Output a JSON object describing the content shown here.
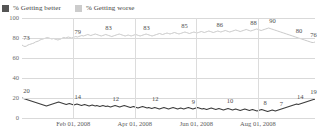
{
  "legend": {
    "position": "top-left",
    "items": [
      {
        "label": "% Getting better",
        "color": "#555555",
        "swatch_name": "legend-swatch-better"
      },
      {
        "label": "% Getting worse",
        "color": "#cccccc",
        "swatch_name": "legend-swatch-worse"
      }
    ]
  },
  "chart_data": {
    "type": "line",
    "title": "",
    "subtitle": "",
    "xlabel": "",
    "ylabel": "",
    "ylim": [
      0,
      100
    ],
    "yticks": [
      0,
      20,
      40,
      60,
      80,
      100
    ],
    "ytick_labels": [
      "0",
      "20",
      "40",
      "60",
      "80",
      "100"
    ],
    "grid": true,
    "xtick_labels": [
      "Feb 01, 2008",
      "Apr 01, 2008",
      "Jun 01, 2008",
      "Aug 01, 2008"
    ],
    "xtick_positions_pct": [
      17.5,
      38.5,
      59.5,
      80.5
    ],
    "legend_position": "top-left",
    "series": [
      {
        "name": "% Getting worse",
        "color": "#c9c9c9",
        "annotations": [
          {
            "value": 73,
            "label": "73",
            "x_pct": 1.5
          },
          {
            "value": 79,
            "label": "79",
            "x_pct": 19.0
          },
          {
            "value": 83,
            "label": "83",
            "x_pct": 29.5
          },
          {
            "value": 83,
            "label": "83",
            "x_pct": 42.5
          },
          {
            "value": 85,
            "label": "85",
            "x_pct": 55.5
          },
          {
            "value": 86,
            "label": "86",
            "x_pct": 67.5
          },
          {
            "value": 88,
            "label": "88",
            "x_pct": 79.0
          },
          {
            "value": 90,
            "label": "90",
            "x_pct": 85.5
          },
          {
            "value": 80,
            "label": "80",
            "x_pct": 94.5
          },
          {
            "value": 76,
            "label": "76",
            "x_pct": 99.5
          }
        ],
        "values": [
          73,
          72,
          71.5,
          72,
          73,
          73.5,
          74,
          74.5,
          75,
          76,
          76.5,
          77,
          78,
          78.5,
          79,
          79.5,
          80,
          80.5,
          80,
          79.5,
          79,
          79.5,
          79,
          78.5,
          78,
          78.5,
          79,
          80,
          80.5,
          80,
          80.5,
          81,
          80.5,
          80,
          80.5,
          81,
          81.5,
          81,
          81.5,
          82,
          82.5,
          82,
          82.5,
          83,
          83.5,
          83,
          82.5,
          83,
          83.5,
          84,
          83.5,
          83,
          82.5,
          82,
          82.5,
          83,
          83.5,
          83,
          82.5,
          82,
          81.5,
          82,
          82.5,
          83,
          83.5,
          84,
          83.5,
          83,
          82.5,
          82,
          82.5,
          83,
          82.5,
          82,
          82.5,
          83,
          83.5,
          83,
          82.5,
          82,
          82.5,
          83,
          83.5,
          84,
          83.5,
          83,
          82.5,
          82,
          82.5,
          83,
          83.5,
          84,
          84.5,
          84,
          83.5,
          84,
          84.5,
          85,
          84.5,
          84,
          84.5,
          85,
          85.5,
          85,
          84.5,
          84,
          84.5,
          85,
          85.5,
          86,
          85.5,
          85,
          84.5,
          85,
          85.5,
          86,
          85.5,
          85,
          85.5,
          86,
          86.5,
          86,
          85.5,
          86,
          86.5,
          87,
          86.5,
          86,
          85.5,
          86,
          86.5,
          87,
          86.5,
          86,
          86.5,
          87,
          87.5,
          87,
          86.5,
          86,
          86.5,
          87,
          87.5,
          88,
          87.5,
          87,
          86.5,
          87,
          87.5,
          88,
          88.5,
          88,
          87.5,
          87,
          87.5,
          88,
          88.5,
          89,
          88.5,
          88,
          87.5,
          88,
          88.5,
          89,
          89.5,
          90,
          89.5,
          89,
          88.5,
          88,
          87.5,
          87,
          86.5,
          86,
          85.5,
          85,
          84.5,
          84,
          83.5,
          83,
          82.5,
          82,
          81.5,
          81,
          80.5,
          80,
          79.5,
          79,
          78.5,
          78,
          77.5,
          77,
          76.5,
          76,
          75.5,
          75.5,
          76
        ]
      },
      {
        "name": "% Getting better",
        "color": "#3d3d3d",
        "annotations": [
          {
            "value": 20,
            "label": "20",
            "x_pct": 1.5
          },
          {
            "value": 14,
            "label": "14",
            "x_pct": 19.0
          },
          {
            "value": 12,
            "label": "12",
            "x_pct": 32.0
          },
          {
            "value": 12,
            "label": "12",
            "x_pct": 45.5
          },
          {
            "value": 9,
            "label": "9",
            "x_pct": 58.5
          },
          {
            "value": 10,
            "label": "10",
            "x_pct": 71.0
          },
          {
            "value": 8,
            "label": "8",
            "x_pct": 83.0
          },
          {
            "value": 7,
            "label": "7",
            "x_pct": 88.5
          },
          {
            "value": 14,
            "label": "14",
            "x_pct": 95.0
          },
          {
            "value": 19,
            "label": "19",
            "x_pct": 99.5
          }
        ],
        "values": [
          20,
          19.5,
          19,
          18.5,
          18,
          17.5,
          17,
          16.5,
          16,
          15.5,
          15,
          14.5,
          14,
          13.5,
          13,
          12.5,
          12,
          12.5,
          13,
          13.5,
          14,
          14.5,
          15,
          15.5,
          16,
          15.5,
          15,
          14.5,
          14,
          13.5,
          14,
          14.5,
          14,
          13.5,
          13,
          13.5,
          14,
          13.5,
          13,
          12.5,
          13,
          13.5,
          13,
          12.5,
          12,
          12.5,
          13,
          12.5,
          12,
          12.5,
          12,
          11.5,
          12,
          12.5,
          12,
          11.5,
          12,
          11.5,
          11,
          11.5,
          12,
          12.5,
          12,
          11.5,
          11,
          11.5,
          12,
          12.5,
          12,
          11.5,
          11,
          10.5,
          11,
          11.5,
          11,
          10.5,
          10,
          10.5,
          11,
          11.5,
          11,
          10.5,
          10,
          10.5,
          10,
          9.5,
          10,
          10.5,
          10,
          9.5,
          9,
          9.5,
          10,
          10.5,
          10,
          9.5,
          9,
          9.5,
          10,
          10.5,
          10,
          9.5,
          9,
          9.5,
          10,
          9.5,
          9,
          9.5,
          10,
          10.5,
          10,
          9.5,
          9,
          9.5,
          10,
          10.5,
          10,
          9.5,
          9,
          9.5,
          9,
          8.5,
          9,
          9.5,
          10,
          9.5,
          9,
          8.5,
          9,
          9.5,
          9,
          8.5,
          8,
          8.5,
          9,
          9.5,
          9,
          8.5,
          8,
          8.5,
          9,
          8.5,
          8,
          7.5,
          8,
          8.5,
          9,
          8.5,
          8,
          7.5,
          8,
          8.5,
          8,
          7.5,
          7,
          7.5,
          8,
          8.5,
          8,
          7.5,
          7,
          6.5,
          7,
          7.5,
          8,
          7.5,
          7,
          7.5,
          8,
          8.5,
          9,
          9.5,
          10,
          10.5,
          11,
          11.5,
          12,
          12.5,
          13,
          13.5,
          14,
          13.5,
          14,
          14.5,
          15,
          15.5,
          16,
          16.5,
          17,
          17.5,
          18,
          18.5,
          19
        ]
      }
    ]
  }
}
